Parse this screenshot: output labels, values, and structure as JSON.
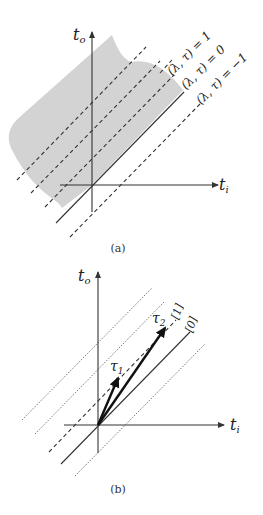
{
  "panel_a": {
    "caption": "(a)",
    "x_axis_label": "t",
    "x_axis_sub": "i",
    "y_axis_label": "t",
    "y_axis_sub": "o",
    "region_color": "#d3d3d3",
    "lines": [
      {
        "label": "(λ, τ) = 1",
        "style": "dashed"
      },
      {
        "label": "(λ, τ) = 0",
        "style": "dashed"
      },
      {
        "label": "(λ, τ) = −1",
        "style": "dashed"
      }
    ]
  },
  "panel_b": {
    "caption": "(b)",
    "x_axis_label": "t",
    "x_axis_sub": "i",
    "y_axis_label": "t",
    "y_axis_sub": "o",
    "line_labels": [
      "[1]",
      "[0]"
    ],
    "vectors": [
      {
        "label": "τ",
        "sub": "1"
      },
      {
        "label": "τ",
        "sub": "2"
      }
    ]
  }
}
